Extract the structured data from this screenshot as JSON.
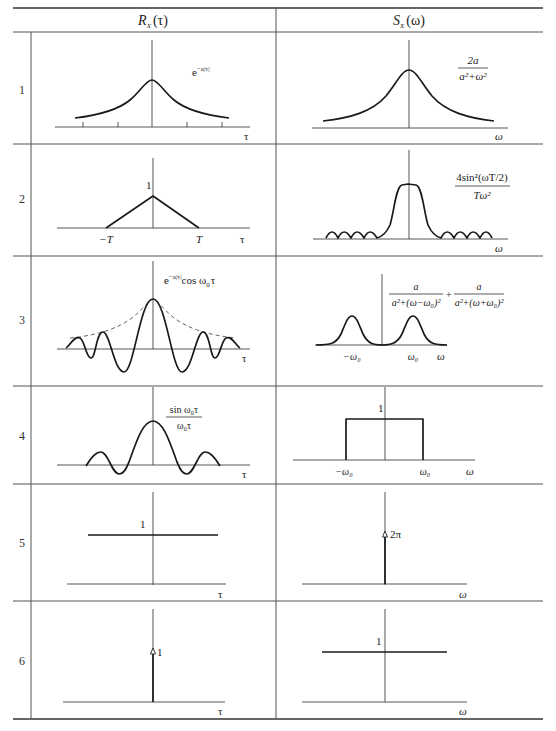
{
  "table": {
    "header": {
      "left": {
        "main": "R",
        "sub": "X",
        "arg": "(τ)"
      },
      "right": {
        "main": "S",
        "sub": "X",
        "arg": "(ω)"
      }
    },
    "rows": [
      {
        "number": "1",
        "left": {
          "formula": "e",
          "formula_exp": "−a|τ|",
          "axis_label": "τ"
        },
        "right": {
          "numerator": "2a",
          "denominator": "a²+ω²",
          "axis_label": "ω"
        }
      },
      {
        "number": "2",
        "left": {
          "peak_label": "1",
          "neg_label": "−T",
          "pos_label": "T",
          "axis_label": "τ"
        },
        "right": {
          "numerator": "4sin²(ωT/2)",
          "denominator": "Tω²",
          "axis_label": "ω"
        }
      },
      {
        "number": "3",
        "left": {
          "formula": "e",
          "formula_exp": "−a|τ|",
          "formula_tail": "cos ω",
          "formula_tail_sub": "0",
          "formula_tail_end": "τ",
          "axis_label": "τ"
        },
        "right": {
          "term1_numerator": "a",
          "term1_denominator": "a²+(ω−ω₀)²",
          "plus": "+",
          "term2_numerator": "a",
          "term2_denominator": "a²+(ω+ω₀)²",
          "neg_label": "−ω₀",
          "pos_label": "ω₀",
          "axis_label": "ω"
        }
      },
      {
        "number": "4",
        "left": {
          "numerator": "sin ω₀τ",
          "denominator": "ω₀τ",
          "axis_label": "τ"
        },
        "right": {
          "height_label": "1",
          "neg_label": "−ω₀",
          "pos_label": "ω₀",
          "axis_label": "ω"
        }
      },
      {
        "number": "5",
        "left": {
          "level_label": "1",
          "axis_label": "τ"
        },
        "right": {
          "impulse_label": "2π",
          "axis_label": "ω"
        }
      },
      {
        "number": "6",
        "left": {
          "impulse_label": "1",
          "axis_label": "τ"
        },
        "right": {
          "level_label": "1",
          "axis_label": "ω"
        }
      }
    ]
  }
}
